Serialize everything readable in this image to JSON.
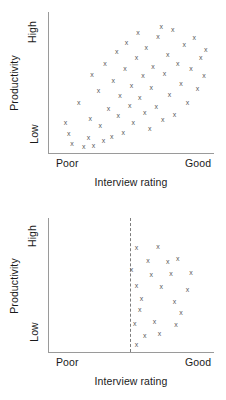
{
  "chart_data": [
    {
      "type": "scatter",
      "id": "unrestricted-range",
      "title": "",
      "xlabel": "Interview rating",
      "ylabel": "Productivity",
      "xticklabels": [
        "Poor",
        "Good"
      ],
      "yticklabels": [
        "Low",
        "High"
      ],
      "xlim": [
        0,
        100
      ],
      "ylim": [
        0,
        100
      ],
      "grid": false,
      "legend": null,
      "marker": "x",
      "marker_color": "#5a5a5a",
      "axis_color": "#9a9a9a",
      "points": [
        {
          "x": 10,
          "y": 22
        },
        {
          "x": 12,
          "y": 14
        },
        {
          "x": 14,
          "y": 7
        },
        {
          "x": 18,
          "y": 36
        },
        {
          "x": 21,
          "y": 5
        },
        {
          "x": 24,
          "y": 11
        },
        {
          "x": 25,
          "y": 25
        },
        {
          "x": 26,
          "y": 56
        },
        {
          "x": 27,
          "y": 6
        },
        {
          "x": 30,
          "y": 45
        },
        {
          "x": 31,
          "y": 20
        },
        {
          "x": 33,
          "y": 9
        },
        {
          "x": 34,
          "y": 64
        },
        {
          "x": 36,
          "y": 32
        },
        {
          "x": 38,
          "y": 12
        },
        {
          "x": 39,
          "y": 52
        },
        {
          "x": 41,
          "y": 72
        },
        {
          "x": 42,
          "y": 27
        },
        {
          "x": 43,
          "y": 41
        },
        {
          "x": 45,
          "y": 15
        },
        {
          "x": 46,
          "y": 60
        },
        {
          "x": 47,
          "y": 79
        },
        {
          "x": 49,
          "y": 34
        },
        {
          "x": 50,
          "y": 48
        },
        {
          "x": 51,
          "y": 22
        },
        {
          "x": 53,
          "y": 68
        },
        {
          "x": 54,
          "y": 86
        },
        {
          "x": 55,
          "y": 40
        },
        {
          "x": 57,
          "y": 55
        },
        {
          "x": 58,
          "y": 29
        },
        {
          "x": 59,
          "y": 75
        },
        {
          "x": 61,
          "y": 18
        },
        {
          "x": 62,
          "y": 47
        },
        {
          "x": 63,
          "y": 62
        },
        {
          "x": 65,
          "y": 33
        },
        {
          "x": 66,
          "y": 83
        },
        {
          "x": 68,
          "y": 90
        },
        {
          "x": 69,
          "y": 24
        },
        {
          "x": 70,
          "y": 57
        },
        {
          "x": 72,
          "y": 70
        },
        {
          "x": 73,
          "y": 42
        },
        {
          "x": 75,
          "y": 88
        },
        {
          "x": 76,
          "y": 28
        },
        {
          "x": 78,
          "y": 64
        },
        {
          "x": 80,
          "y": 50
        },
        {
          "x": 82,
          "y": 77
        },
        {
          "x": 84,
          "y": 36
        },
        {
          "x": 86,
          "y": 60
        },
        {
          "x": 88,
          "y": 82
        },
        {
          "x": 90,
          "y": 46
        },
        {
          "x": 92,
          "y": 68
        },
        {
          "x": 94,
          "y": 55
        },
        {
          "x": 95,
          "y": 74
        }
      ]
    },
    {
      "type": "scatter",
      "id": "restricted-range",
      "title": "",
      "xlabel": "Interview rating",
      "ylabel": "Productivity",
      "xticklabels": [
        "Poor",
        "Good"
      ],
      "yticklabels": [
        "Low",
        "High"
      ],
      "xlim": [
        0,
        100
      ],
      "ylim": [
        0,
        100
      ],
      "grid": false,
      "legend": null,
      "marker": "x",
      "marker_color": "#5a5a5a",
      "axis_color": "#9a9a9a",
      "cutoff": {
        "x": 49,
        "style": "dashed",
        "color": "#7d7d7d"
      },
      "points": [
        {
          "x": 53,
          "y": 78
        },
        {
          "x": 66,
          "y": 79
        },
        {
          "x": 60,
          "y": 69
        },
        {
          "x": 72,
          "y": 68
        },
        {
          "x": 78,
          "y": 70
        },
        {
          "x": 50,
          "y": 62
        },
        {
          "x": 62,
          "y": 58
        },
        {
          "x": 74,
          "y": 59
        },
        {
          "x": 86,
          "y": 60
        },
        {
          "x": 53,
          "y": 50
        },
        {
          "x": 68,
          "y": 49
        },
        {
          "x": 84,
          "y": 47
        },
        {
          "x": 56,
          "y": 40
        },
        {
          "x": 76,
          "y": 38
        },
        {
          "x": 55,
          "y": 32
        },
        {
          "x": 80,
          "y": 30
        },
        {
          "x": 52,
          "y": 22
        },
        {
          "x": 64,
          "y": 23
        },
        {
          "x": 77,
          "y": 21
        },
        {
          "x": 58,
          "y": 13
        },
        {
          "x": 67,
          "y": 14
        },
        {
          "x": 53,
          "y": 6
        }
      ]
    }
  ],
  "charts": [
    {
      "name": "top",
      "ylabel": "Productivity",
      "ytick_high": "High",
      "ytick_low": "Low",
      "xtick_left": "Poor",
      "xtick_right": "Good",
      "xlabel": "Interview rating"
    },
    {
      "name": "bottom",
      "ylabel": "Productivity",
      "ytick_high": "High",
      "ytick_low": "Low",
      "xtick_left": "Poor",
      "xtick_right": "Good",
      "xlabel": "Interview rating"
    }
  ]
}
